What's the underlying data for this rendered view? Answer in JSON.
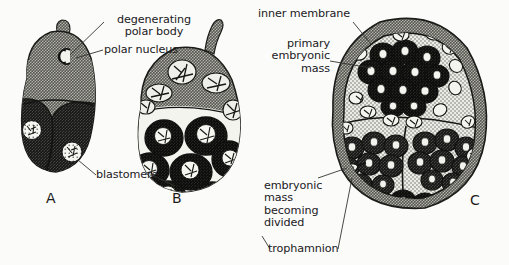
{
  "figure": {
    "background_color": "#fbfbf9",
    "ink_color": "#20201e"
  },
  "labels": {
    "degenerating_polar_body": "degenerating\npolar body",
    "polar_nucleus": "polar nucleus",
    "blastomere": "blastomere",
    "inner_membrane": "inner membrane",
    "primary_embryonic_mass": "primary\nembryonic\nmass",
    "embryonic_mass_becoming_divided": "embryonic\nmass\nbecoming\ndivided",
    "trophamnion": "trophamnion"
  },
  "stages": [
    {
      "letter": "A",
      "name": "three-celled-embryo"
    },
    {
      "letter": "B",
      "name": "multicellular-embryo"
    },
    {
      "letter": "C",
      "name": "polyembryonic-mass"
    }
  ],
  "colors": {
    "cytoplasm_gray": "#8d8d88",
    "dark_cell": "#2e2e2c",
    "mid_cell": "#4f4f4c",
    "light_stipple": "#e6e6e0",
    "nucleus_white": "#f7f7f2",
    "outline": "#1b1b19",
    "leader_line": "#33332f"
  }
}
